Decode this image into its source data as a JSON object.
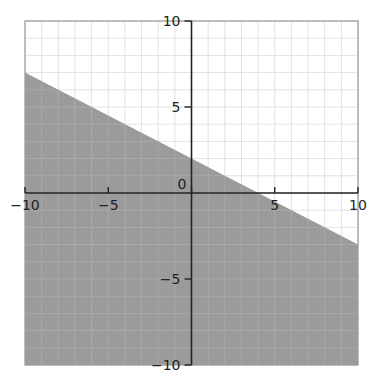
{
  "chart_data": {
    "type": "area",
    "title": "",
    "xlabel": "",
    "ylabel": "",
    "xlim": [
      -10,
      10
    ],
    "ylim": [
      -10,
      10
    ],
    "grid": true,
    "grid_step": 1,
    "x_ticks": [
      -10,
      -5,
      0,
      5,
      10
    ],
    "y_ticks": [
      -10,
      -5,
      5,
      10
    ],
    "x_tick_labels": [
      "−10",
      "−5",
      "0",
      "5",
      "10"
    ],
    "y_tick_labels": [
      "−10",
      "−5",
      "5",
      "10"
    ],
    "inequality": "y <= -0.5x + 2",
    "boundary_line": {
      "slope": -0.5,
      "intercept": 2,
      "style": "solid-edge",
      "points": [
        [
          -10,
          7
        ],
        [
          10,
          -3
        ]
      ]
    },
    "shaded_region": "below",
    "series": [
      {
        "name": "boundary",
        "x": [
          -10,
          4,
          10
        ],
        "y": [
          7,
          0,
          -3
        ]
      }
    ]
  },
  "colors": {
    "shade": "#9b9b9b",
    "grid": "#e2e2e2",
    "grid_on_shade": "#b0b0b0",
    "axis": "#222222",
    "border": "#9a9a9a"
  }
}
